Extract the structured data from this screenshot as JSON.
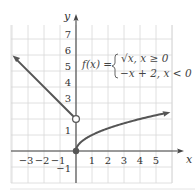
{
  "chart_data": {
    "type": "line",
    "title": "",
    "xlabel": "x",
    "ylabel": "y",
    "xlim": [
      -4.1,
      6
    ],
    "ylim": [
      -2,
      8.3
    ],
    "grid": true,
    "x_ticks": [
      -3,
      -2,
      -1,
      1,
      2,
      3,
      4,
      5
    ],
    "x_tick_labels": [
      "−3",
      "−2",
      "−1",
      "1",
      "2",
      "3",
      "4",
      "5"
    ],
    "y_ticks": [
      -1,
      1,
      3,
      4,
      5,
      6,
      7
    ],
    "y_tick_labels": [
      "−1",
      "1",
      "3",
      "4",
      "5",
      "6",
      "7"
    ],
    "function_label": "f(x) =",
    "pieces": [
      {
        "expression": "√x, x ≥ 0",
        "domain": [
          0,
          5.9
        ],
        "type": "sqrt",
        "start_point": {
          "x": 0,
          "y": 0,
          "closed": true
        },
        "end_arrow": true
      },
      {
        "expression": "−x + 2, x < 0",
        "domain": [
          -3.9,
          0
        ],
        "type": "linear",
        "slope": -1,
        "intercept": 2,
        "end_point": {
          "x": 0,
          "y": 2,
          "closed": false
        },
        "start_arrow": true
      }
    ],
    "colors": {
      "curve": "#555555",
      "grid": "#d8d8d8",
      "axis": "#444444"
    }
  }
}
